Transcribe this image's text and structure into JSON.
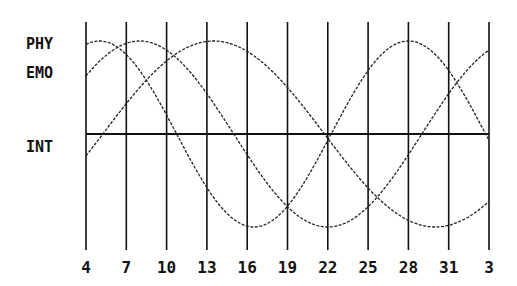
{
  "chart_data": {
    "type": "line",
    "title": "",
    "xlabel": "",
    "ylabel": "",
    "x_tick_labels": [
      "4",
      "7",
      "10",
      "13",
      "16",
      "19",
      "22",
      "25",
      "28",
      "31",
      "3"
    ],
    "x_day_offsets": [
      0,
      3,
      6,
      9,
      12,
      15,
      18,
      21,
      24,
      27,
      30
    ],
    "ylim": [
      -1,
      1
    ],
    "grid": {
      "vertical": true,
      "horizontal_zero_line": true
    },
    "legend_position": "left",
    "series": [
      {
        "name": "PHY",
        "period_days": 23,
        "start_value": 0.95,
        "peak_day_offset": 1.0,
        "values_at_ticks": [
          0.95,
          0.89,
          0.21,
          -0.59,
          -0.99,
          -0.52,
          0.01,
          0.63,
          1.0,
          0.69,
          0.05
        ]
      },
      {
        "name": "EMO",
        "period_days": 28,
        "start_value": 0.63,
        "peak_day_offset": 4.0,
        "values_at_ticks": [
          0.63,
          0.97,
          0.86,
          0.22,
          -0.43,
          -0.91,
          -0.99,
          -0.62,
          0.0,
          0.62,
          0.88
        ]
      },
      {
        "name": "INT",
        "period_days": 33,
        "start_value": -0.26,
        "peak_day_offset": 9.5,
        "values_at_ticks": [
          -0.26,
          0.29,
          0.76,
          0.99,
          0.91,
          0.54,
          0.01,
          -0.52,
          -0.88,
          -1.0,
          -0.76
        ]
      }
    ],
    "annotations": []
  },
  "legend": {
    "labels": [
      "PHY",
      "EMO",
      "INT"
    ]
  },
  "colors": {
    "background": "#ffffff",
    "ink": "#111111"
  }
}
